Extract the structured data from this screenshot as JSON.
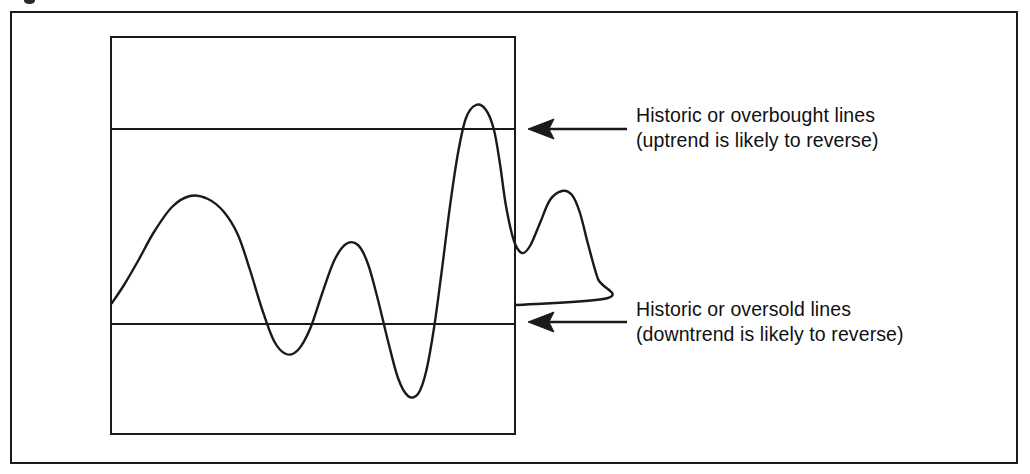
{
  "figure": {
    "background_color": "#ffffff",
    "ink_color": "#1a1a1a",
    "text_color": "#111111"
  },
  "annotations": [
    {
      "id": "overbought",
      "line1": "Historic or overbought lines",
      "line2": "(uptrend is likely to reverse)",
      "arrow": "left-arrow-icon",
      "target_level": "overbought"
    },
    {
      "id": "oversold",
      "line1": "Historic or oversold lines",
      "line2": "(downtrend is likely to reverse)",
      "arrow": "left-arrow-icon",
      "target_level": "oversold"
    }
  ],
  "chart_data": {
    "type": "line",
    "title": "",
    "subtitle": "",
    "xlabel": "",
    "ylabel": "",
    "grid": false,
    "legend_position": "right",
    "axis_ticks": false,
    "xlim": [
      0,
      406
    ],
    "ylim": [
      0,
      399
    ],
    "note": "Oscillator-style indicator curve drawn in a plain box with two horizontal reference bands. Coordinates are in plot-box pixel space: x rightward from the box left edge, y downward from the box top edge.",
    "reference_lines": [
      {
        "name": "Historic or overbought lines",
        "level_label": "overbought",
        "y": 93,
        "span": "full-width"
      },
      {
        "name": "Historic or oversold lines",
        "level_label": "oversold",
        "y": 288,
        "span": "full-width"
      }
    ],
    "series": [
      {
        "name": "indicator",
        "points": [
          [
            2,
            267
          ],
          [
            14,
            249
          ],
          [
            28,
            225
          ],
          [
            44,
            196
          ],
          [
            62,
            171
          ],
          [
            80,
            160
          ],
          [
            98,
            163
          ],
          [
            114,
            176
          ],
          [
            128,
            199
          ],
          [
            140,
            234
          ],
          [
            152,
            273
          ],
          [
            164,
            305
          ],
          [
            176,
            318
          ],
          [
            188,
            314
          ],
          [
            200,
            293
          ],
          [
            212,
            258
          ],
          [
            224,
            225
          ],
          [
            236,
            208
          ],
          [
            248,
            209
          ],
          [
            258,
            228
          ],
          [
            268,
            264
          ],
          [
            278,
            305
          ],
          [
            288,
            342
          ],
          [
            298,
            360
          ],
          [
            308,
            358
          ],
          [
            316,
            336
          ],
          [
            324,
            292
          ],
          [
            332,
            233
          ],
          [
            340,
            170
          ],
          [
            348,
            117
          ],
          [
            356,
            82
          ],
          [
            366,
            69
          ],
          [
            376,
            74
          ],
          [
            384,
            94
          ],
          [
            390,
            128
          ],
          [
            396,
            170
          ],
          [
            404,
            205
          ],
          [
            412,
            217
          ],
          [
            420,
            210
          ],
          [
            430,
            187
          ],
          [
            440,
            164
          ],
          [
            452,
            155
          ],
          [
            462,
            159
          ],
          [
            470,
            177
          ],
          [
            478,
            208
          ],
          [
            488,
            243
          ],
          [
            498,
            262
          ],
          [
            406,
            269
          ]
        ]
      }
    ],
    "features": {
      "start_value": [
        2,
        267
      ],
      "peaks": [
        {
          "label": "peak-1",
          "x": 80,
          "y": 160
        },
        {
          "label": "peak-2",
          "x": 240,
          "y": 208
        },
        {
          "label": "peak-3-overbought-breach",
          "x": 368,
          "y": 69
        },
        {
          "label": "peak-4",
          "x": 455,
          "y": 155
        }
      ],
      "troughs": [
        {
          "label": "trough-1",
          "x": 176,
          "y": 318
        },
        {
          "label": "trough-2-oversold-breach",
          "x": 303,
          "y": 360
        },
        {
          "label": "trough-3",
          "x": 414,
          "y": 217
        }
      ],
      "end_value": [
        406,
        269
      ]
    }
  }
}
